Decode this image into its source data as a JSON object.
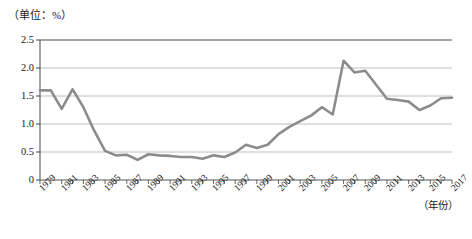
{
  "chart_data": {
    "type": "line",
    "title": "",
    "unit_note": "（单位：%）",
    "xlabel": "（年份）",
    "ylabel": "",
    "ylim": [
      0,
      2.5
    ],
    "ytick_labels": [
      "0",
      "0.5",
      "1.0",
      "1.5",
      "2.0",
      "2.5"
    ],
    "ytick_values": [
      0,
      0.5,
      1.0,
      1.5,
      2.0,
      2.5
    ],
    "grid": true,
    "legend": false,
    "line_color": "#8c8c8c",
    "xtick_labels": [
      "1979",
      "1981",
      "1983",
      "1985",
      "1987",
      "1989",
      "1991",
      "1993",
      "1995",
      "1997",
      "1999",
      "2001",
      "2003",
      "2005",
      "2007",
      "2009",
      "2011",
      "2013",
      "2015",
      "2017"
    ],
    "x": [
      1979,
      1980,
      1981,
      1982,
      1983,
      1984,
      1985,
      1986,
      1987,
      1988,
      1989,
      1990,
      1991,
      1992,
      1993,
      1994,
      1995,
      1996,
      1997,
      1998,
      1999,
      2000,
      2001,
      2002,
      2003,
      2004,
      2005,
      2006,
      2007,
      2008,
      2009,
      2010,
      2011,
      2012,
      2013,
      2014,
      2015,
      2016,
      2017
    ],
    "values": [
      1.6,
      1.6,
      1.27,
      1.62,
      1.3,
      0.88,
      0.52,
      0.44,
      0.45,
      0.36,
      0.46,
      0.44,
      0.43,
      0.41,
      0.41,
      0.38,
      0.44,
      0.41,
      0.49,
      0.63,
      0.57,
      0.63,
      0.82,
      0.95,
      1.05,
      1.15,
      1.3,
      1.17,
      2.13,
      1.92,
      1.95,
      1.7,
      1.45,
      1.43,
      1.4,
      1.25,
      1.33,
      1.46,
      1.47
    ]
  }
}
